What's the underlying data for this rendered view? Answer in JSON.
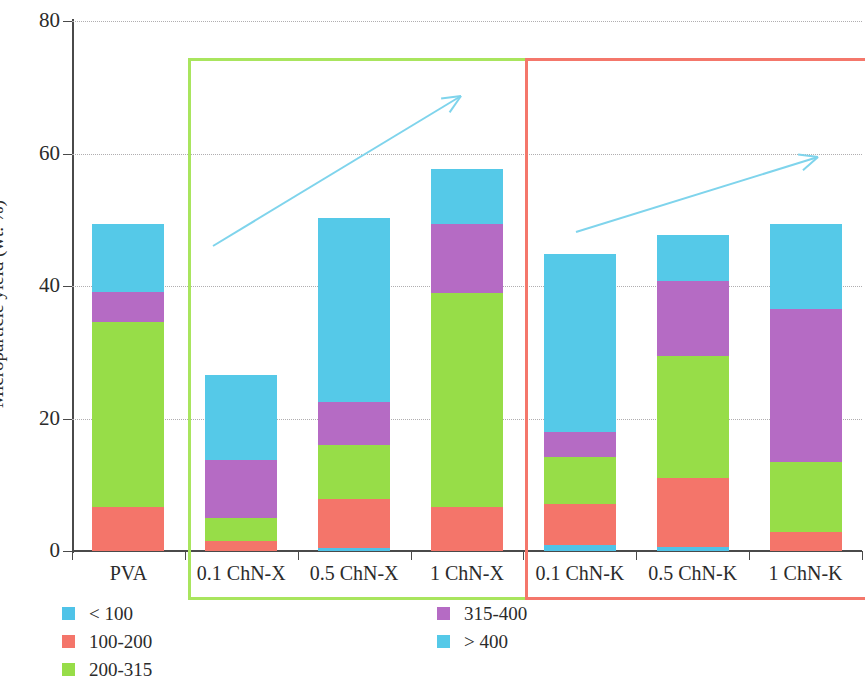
{
  "chart_data": {
    "type": "bar",
    "subtype": "stacked-bar",
    "title": "",
    "xlabel": "",
    "ylabel": "Microparticle yield (wt. %)",
    "ylim": [
      0,
      80
    ],
    "yticks": [
      0,
      20,
      40,
      60,
      80
    ],
    "ytick_labels": [
      "0",
      "20",
      "40",
      "60",
      "80"
    ],
    "grid": "horizontal-dotted",
    "legend_position": "bottom-left",
    "categories": [
      "PVA",
      "0.1 ChN-X",
      "0.5 ChN-X",
      "1 ChN-X",
      "0.1 ChN-K",
      "0.5 ChN-K",
      "1 ChN-K"
    ],
    "series": [
      {
        "name": "< 100",
        "color": "#4FC3E8",
        "values": [
          0.0,
          0.0,
          0.5,
          0.0,
          0.9,
          0.6,
          0.0
        ]
      },
      {
        "name": "100-200",
        "color": "#F4756A",
        "values": [
          6.6,
          1.5,
          7.4,
          6.7,
          6.2,
          10.4,
          2.9
        ]
      },
      {
        "name": "200-315",
        "color": "#97DD48",
        "values": [
          27.9,
          3.5,
          8.1,
          32.2,
          7.1,
          18.4,
          10.6
        ]
      },
      {
        "name": "315-400",
        "color": "#B56BC4",
        "values": [
          4.6,
          8.7,
          6.5,
          10.4,
          3.7,
          11.4,
          23.1
        ]
      },
      {
        "name": "> 400",
        "color": "#55C9E8",
        "values": [
          10.2,
          12.8,
          27.7,
          8.4,
          26.9,
          6.9,
          12.7
        ]
      }
    ],
    "totals": [
      49.3,
      26.5,
      50.2,
      57.7,
      43.8,
      47.7,
      49.3
    ],
    "legend": [
      {
        "label": "< 100",
        "color": "#4FC3E8",
        "column": 0,
        "row": 0
      },
      {
        "label": "100-200",
        "color": "#F4756A",
        "column": 0,
        "row": 1
      },
      {
        "label": "200-315",
        "color": "#97DD48",
        "column": 0,
        "row": 2
      },
      {
        "label": "315-400",
        "color": "#B56BC4",
        "column": 1,
        "row": 0
      },
      {
        "label": "> 400",
        "color": "#55C9E8",
        "column": 1,
        "row": 1
      }
    ],
    "annotations": {
      "group_boxes": [
        {
          "name": "chn-x-group",
          "label": "",
          "color": "#A9E55E",
          "categories": [
            "0.1 ChN-X",
            "0.5 ChN-X",
            "1 ChN-X"
          ]
        },
        {
          "name": "chn-k-group",
          "label": "",
          "color": "#F4776B",
          "categories": [
            "0.1 ChN-K",
            "0.5 ChN-K",
            "1 ChN-K"
          ]
        }
      ],
      "trend_arrows": [
        {
          "name": "chn-x-trend-arrow",
          "color": "#7FD4EC",
          "direction": "up-right",
          "group": "ChN-X"
        },
        {
          "name": "chn-k-trend-arrow",
          "color": "#7FD4EC",
          "direction": "up-right",
          "group": "ChN-K"
        }
      ]
    }
  }
}
